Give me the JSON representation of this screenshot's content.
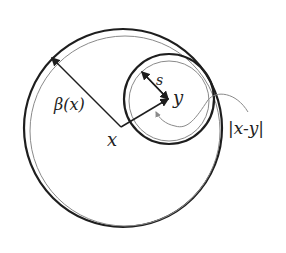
{
  "diagram": {
    "labels": {
      "beta": "β(x)",
      "x": "x",
      "y": "y",
      "s": "s",
      "distance": "|x-y|"
    },
    "colors": {
      "stroke": "#1e1e1e",
      "thin_stroke": "#8a8a8a",
      "background": "#ffffff"
    }
  }
}
